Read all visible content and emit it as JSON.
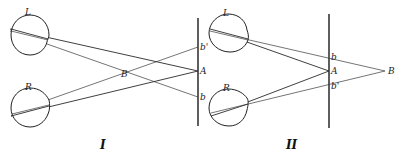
{
  "diagram": {
    "panels": [
      {
        "id": "I",
        "label": "I",
        "eyes": {
          "left_label": "L",
          "right_label": "R"
        },
        "screen_points": {
          "top": "b'",
          "middle": "A",
          "bottom": "b"
        },
        "intersection_label": "B"
      },
      {
        "id": "II",
        "label": "II",
        "eyes": {
          "left_label": "L",
          "right_label": "R"
        },
        "screen_points": {
          "top": "b",
          "middle": "A",
          "bottom": "b'"
        },
        "external_point_label": "B"
      }
    ],
    "colors": {
      "line": "#2a2a2a",
      "background": "#ffffff"
    }
  }
}
